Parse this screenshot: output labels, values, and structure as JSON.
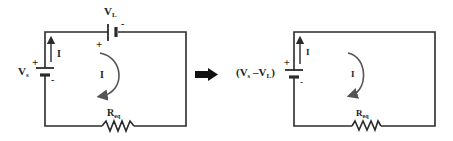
{
  "diagram": {
    "type": "circuit-equivalence",
    "left_circuit": {
      "source": {
        "label": "V",
        "subscript": "s",
        "plus": "+",
        "minus": "-"
      },
      "load_source": {
        "label": "V",
        "subscript": "L",
        "plus": "+",
        "minus": "-"
      },
      "branch_current": "I",
      "loop_current": "I",
      "resistor": {
        "label": "R",
        "subscript": "eq"
      }
    },
    "transform_arrow": "right-arrow",
    "right_circuit": {
      "source": {
        "label_open": "(V",
        "sub1": "s",
        "mid": " –V",
        "sub2": "L",
        "label_close": ")",
        "plus": "+",
        "minus": "-"
      },
      "branch_current": "I",
      "loop_current": "I",
      "resistor": {
        "label": "R",
        "subscript": "eq"
      }
    }
  }
}
